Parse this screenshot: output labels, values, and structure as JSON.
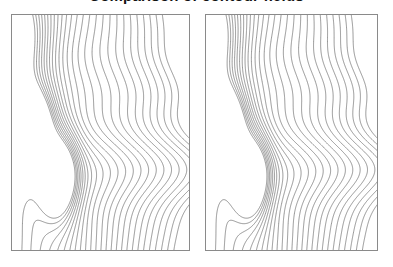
{
  "figure": {
    "title": "Comparison of contour fields",
    "title_visible": "partially cropped at top edge",
    "background_color": "#ffffff",
    "width": 393,
    "height": 267
  },
  "panels": [
    {
      "id": "left-panel",
      "label": "Left contour plot",
      "x": 11,
      "y": 14,
      "width": 179,
      "height": 237,
      "border_color": "#8a8a8a",
      "line_color": "#555555"
    },
    {
      "id": "right-panel",
      "label": "Right contour plot",
      "x": 205,
      "y": 14,
      "width": 173,
      "height": 237,
      "border_color": "#8a8a8a",
      "line_color": "#555555"
    }
  ],
  "chart_data": {
    "type": "line",
    "subtype": "contour",
    "title": "Comparison of contour fields",
    "subtitle": "",
    "xlabel": "",
    "ylabel": "",
    "xlim": [
      0,
      1
    ],
    "ylim": [
      0,
      1
    ],
    "grid": false,
    "legend": "none",
    "axis_ticks": "none",
    "axis_labels": "none",
    "panel_count": 2,
    "panels_identical": true,
    "n_levels": 26,
    "level_min": 0.04,
    "level_max": 0.96,
    "level_step": 0.0368,
    "annotations": [],
    "field_description": "Smooth scalar field with two closed-contour extrema on the left side and quasi-vertical contour bands sweeping across the right two thirds",
    "features": [
      {
        "name": "primary-extremum",
        "kind": "closed-contour-center",
        "x": 0.11,
        "y": 0.47,
        "amplitude": 1.0,
        "sigma_x": 0.085,
        "sigma_y": 0.1,
        "rings": 9
      },
      {
        "name": "secondary-extremum",
        "kind": "closed-contour-center",
        "x": 0.27,
        "y": 0.68,
        "amplitude": 0.82,
        "sigma_x": 0.07,
        "sigma_y": 0.12,
        "rings": 7
      },
      {
        "name": "upper-left-shoulder",
        "kind": "gradient-shoulder",
        "x": 0.04,
        "y": 0.12,
        "amplitude": 0.45,
        "sigma_x": 0.12,
        "sigma_y": 0.16,
        "rings": 0
      },
      {
        "name": "right-band-sweep",
        "kind": "vertical-band-gradient",
        "x": 0.72,
        "y": 0.5,
        "amplitude": 0.0,
        "sigma_x": 0.0,
        "sigma_y": 0.0,
        "rings": 0
      }
    ],
    "series": [
      {
        "name": "left panel contours",
        "values": [
          0.04,
          0.077,
          0.114,
          0.15,
          0.187,
          0.224,
          0.261,
          0.298,
          0.335,
          0.371,
          0.408,
          0.445,
          0.482,
          0.519,
          0.556,
          0.592,
          0.629,
          0.666,
          0.703,
          0.74,
          0.777,
          0.813,
          0.85,
          0.887,
          0.924,
          0.96
        ]
      },
      {
        "name": "right panel contours",
        "values": [
          0.04,
          0.077,
          0.114,
          0.15,
          0.187,
          0.224,
          0.261,
          0.298,
          0.335,
          0.371,
          0.408,
          0.445,
          0.482,
          0.519,
          0.556,
          0.592,
          0.629,
          0.666,
          0.703,
          0.74,
          0.777,
          0.813,
          0.85,
          0.887,
          0.924,
          0.96
        ]
      }
    ]
  }
}
